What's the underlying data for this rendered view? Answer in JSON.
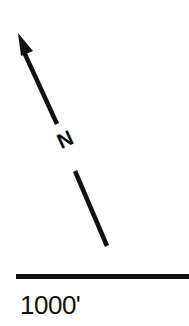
{
  "north_arrow": {
    "label": "N",
    "color": "#111111"
  },
  "scale_bar": {
    "label": "1000'",
    "color": "#111111"
  }
}
